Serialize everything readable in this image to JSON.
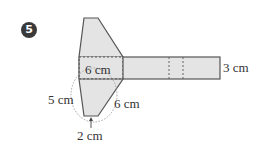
{
  "problem": {
    "number": "5"
  },
  "figure": {
    "fill_color": "#e4e4e4",
    "stroke_color": "#555555",
    "labels": {
      "middle_width": "6 cm",
      "strip_height": "3 cm",
      "slant_left": "5 cm",
      "slant_right": "6 cm",
      "bottom_edge": "2 cm"
    }
  }
}
